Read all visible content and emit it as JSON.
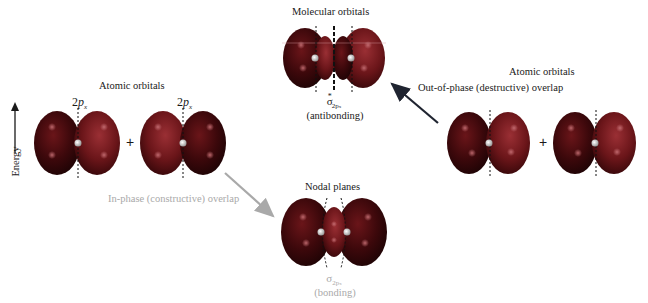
{
  "energy_axis": {
    "label": "Energy"
  },
  "left_group": {
    "title": "Atomic orbitals",
    "orbital_1_label": {
      "prefix": "2",
      "symbol": "p",
      "subscript": "x"
    },
    "orbital_2_label": {
      "prefix": "2",
      "symbol": "p",
      "subscript": "x"
    },
    "operator": "+"
  },
  "right_group": {
    "title": "Atomic orbitals",
    "operator": "+"
  },
  "antibonding": {
    "title": "Molecular orbitals",
    "symbol": "σ",
    "superscript": "*",
    "subscript": "2p",
    "subscript_sub": "x",
    "caption": "(antibonding)"
  },
  "bonding": {
    "title": "Nodal planes",
    "symbol": "σ",
    "subscript": "2p",
    "subscript_sub": "x",
    "caption": "(bonding)"
  },
  "arrows": {
    "out_of_phase": {
      "label": "Out-of-phase (destructive) overlap",
      "color": "#1f2430"
    },
    "in_phase": {
      "label": "In-phase (constructive) overlap",
      "color": "#a9a9a9"
    }
  },
  "colors": {
    "lobe_dark": "#2a0507",
    "lobe_mid": "#5e1216",
    "lobe_light": "#8a2a2e",
    "highlight": "#b85a5e"
  }
}
